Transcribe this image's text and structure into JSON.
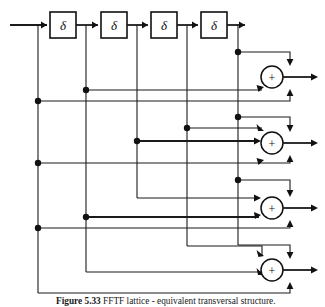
{
  "figure": {
    "kind": "signal-flow-block-diagram",
    "caption": {
      "label": "Figure 5.33",
      "text": "FFTF lattice - equivalent transversal structure.",
      "note": "caption is cropped at the bottom edge of the screenshot and only the tops of the glyphs are visible"
    },
    "colors": {
      "line": "#1a1a1a",
      "block_fill": "#ffffff",
      "block_stroke": "#111111",
      "background": "#ffffff"
    },
    "delay_blocks": [
      {
        "id": "delay-1",
        "label": "δ",
        "x": 50,
        "y": 12,
        "w": 26,
        "h": 26
      },
      {
        "id": "delay-2",
        "label": "δ",
        "x": 101,
        "y": 12,
        "w": 26,
        "h": 26
      },
      {
        "id": "delay-3",
        "label": "δ",
        "x": 151,
        "y": 12,
        "w": 26,
        "h": 26
      },
      {
        "id": "delay-4",
        "label": "δ",
        "x": 201,
        "y": 12,
        "w": 26,
        "h": 26
      }
    ],
    "adders": [
      {
        "id": "adder-1",
        "label": "+",
        "cx": 272,
        "cy": 77,
        "r": 11
      },
      {
        "id": "adder-2",
        "label": "+",
        "cx": 272,
        "cy": 143,
        "r": 11
      },
      {
        "id": "adder-3",
        "label": "+",
        "cx": 272,
        "cy": 208,
        "r": 11
      },
      {
        "id": "adder-4",
        "label": "+",
        "cx": 272,
        "cy": 270,
        "r": 11
      }
    ],
    "taps": [
      {
        "id": "tap-input",
        "x": 38
      },
      {
        "id": "tap-1",
        "x": 86
      },
      {
        "id": "tap-2",
        "x": 137
      },
      {
        "id": "tap-3",
        "x": 187
      },
      {
        "id": "tap-4",
        "x": 238
      }
    ],
    "junction_dots": [
      {
        "x": 38,
        "y": 101
      },
      {
        "x": 38,
        "y": 163
      },
      {
        "x": 38,
        "y": 211
      },
      {
        "x": 86,
        "y": 90
      },
      {
        "x": 86,
        "y": 217
      },
      {
        "x": 137,
        "y": 141
      },
      {
        "x": 187,
        "y": 128
      },
      {
        "x": 238,
        "y": 52
      },
      {
        "x": 238,
        "y": 117
      },
      {
        "x": 238,
        "y": 180
      }
    ],
    "outputs": [
      {
        "id": "output-1",
        "y": 77
      },
      {
        "id": "output-2",
        "y": 143
      },
      {
        "id": "output-3",
        "y": 208
      },
      {
        "id": "output-4",
        "y": 270
      }
    ]
  }
}
